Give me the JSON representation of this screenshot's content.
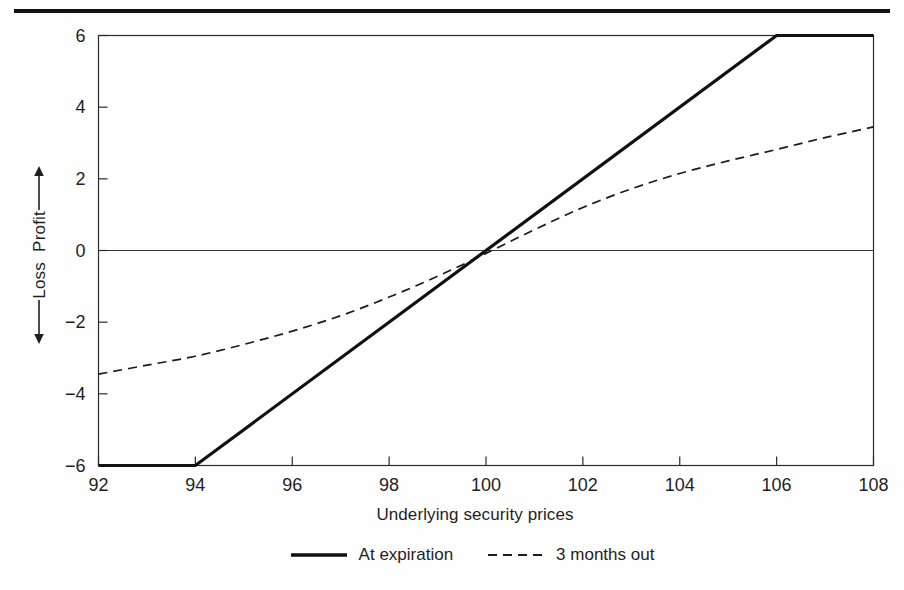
{
  "figure": {
    "kind": "options-payoff-diagram",
    "background_color": "#fefefe",
    "ink_color": "#1a1a1a"
  },
  "chart_data": {
    "type": "line",
    "title": "",
    "subtitle": "",
    "xlabel": "Underlying security prices",
    "ylabel": "Profit / Loss",
    "ylabel_parts": {
      "positive": "Profit",
      "negative": "Loss",
      "positive_arrow": "up-arrow",
      "negative_arrow": "down-arrow"
    },
    "xlim": [
      92,
      108
    ],
    "ylim": [
      -6,
      6
    ],
    "xticks": [
      92,
      94,
      96,
      98,
      100,
      102,
      104,
      106,
      108
    ],
    "xticklabels": [
      "92",
      "94",
      "96",
      "98",
      "100",
      "102",
      "104",
      "106",
      "108"
    ],
    "yticks": [
      -6,
      -4,
      -2,
      0,
      2,
      4,
      6
    ],
    "yticklabels": [
      "−6",
      "−4",
      "−2",
      "0",
      "2",
      "4",
      "6"
    ],
    "grid": false,
    "zero_line": true,
    "legend_position": "below-axis-center",
    "series": [
      {
        "name": "At expiration",
        "style": "solid",
        "linewidth": 3.2,
        "color": "#111111",
        "x": [
          92,
          94,
          106,
          108
        ],
        "values": [
          -6,
          -6,
          6,
          6
        ]
      },
      {
        "name": "3 months out",
        "style": "dashed",
        "linewidth": 1.7,
        "color": "#1c1c1c",
        "dash_pattern": "9 6",
        "x": [
          92,
          93,
          94,
          95,
          96,
          97,
          98,
          99,
          100,
          101,
          102,
          103,
          104,
          105,
          106,
          107,
          108
        ],
        "values": [
          -3.45,
          -3.2,
          -2.95,
          -2.62,
          -2.25,
          -1.82,
          -1.3,
          -0.72,
          -0.08,
          0.58,
          1.2,
          1.72,
          2.15,
          2.5,
          2.82,
          3.15,
          3.45
        ]
      }
    ],
    "annotations": []
  },
  "legend": {
    "items": [
      {
        "label": "At expiration",
        "swatch": "solid-line-swatch"
      },
      {
        "label": "3 months out",
        "swatch": "dashed-line-swatch"
      }
    ]
  },
  "axis": {
    "x_title": "Underlying security prices",
    "y_profit_label": "Profit",
    "y_loss_label": "Loss"
  }
}
